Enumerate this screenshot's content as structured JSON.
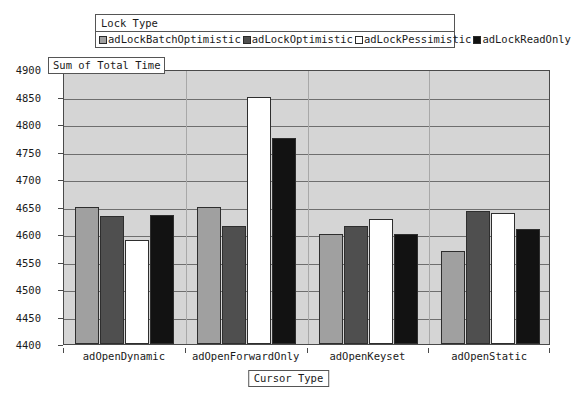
{
  "legend": {
    "title": "Lock Type",
    "items": [
      {
        "label": "adLockBatchOptimistic",
        "color": "#a0a0a0"
      },
      {
        "label": "adLockOptimistic",
        "color": "#4f4f4f"
      },
      {
        "label": "adLockPessimistic",
        "color": "#ffffff"
      },
      {
        "label": "adLockReadOnly",
        "color": "#121212"
      }
    ]
  },
  "axis": {
    "y_title": "Sum of Total Time",
    "x_title": "Cursor Type"
  },
  "chart_data": {
    "type": "bar",
    "title": "",
    "xlabel": "Cursor Type",
    "ylabel": "Sum of Total Time",
    "ylim": [
      4400,
      4900
    ],
    "ytick_step": 50,
    "yticks": [
      4900,
      4850,
      4800,
      4750,
      4700,
      4650,
      4600,
      4550,
      4500,
      4450,
      4400
    ],
    "grid": true,
    "legend_position": "top",
    "categories": [
      "adOpenDynamic",
      "adOpenForwardOnly",
      "adOpenKeyset",
      "adOpenStatic"
    ],
    "series": [
      {
        "name": "adLockBatchOptimistic",
        "color": "#a0a0a0",
        "values": [
          4650,
          4650,
          4600,
          4570
        ]
      },
      {
        "name": "adLockOptimistic",
        "color": "#4f4f4f",
        "values": [
          4632,
          4614,
          4614,
          4641
        ]
      },
      {
        "name": "adLockPessimistic",
        "color": "#ffffff",
        "values": [
          4590,
          4850,
          4628,
          4639
        ]
      },
      {
        "name": "adLockReadOnly",
        "color": "#121212",
        "values": [
          4635,
          4775,
          4600,
          4609
        ]
      }
    ]
  }
}
